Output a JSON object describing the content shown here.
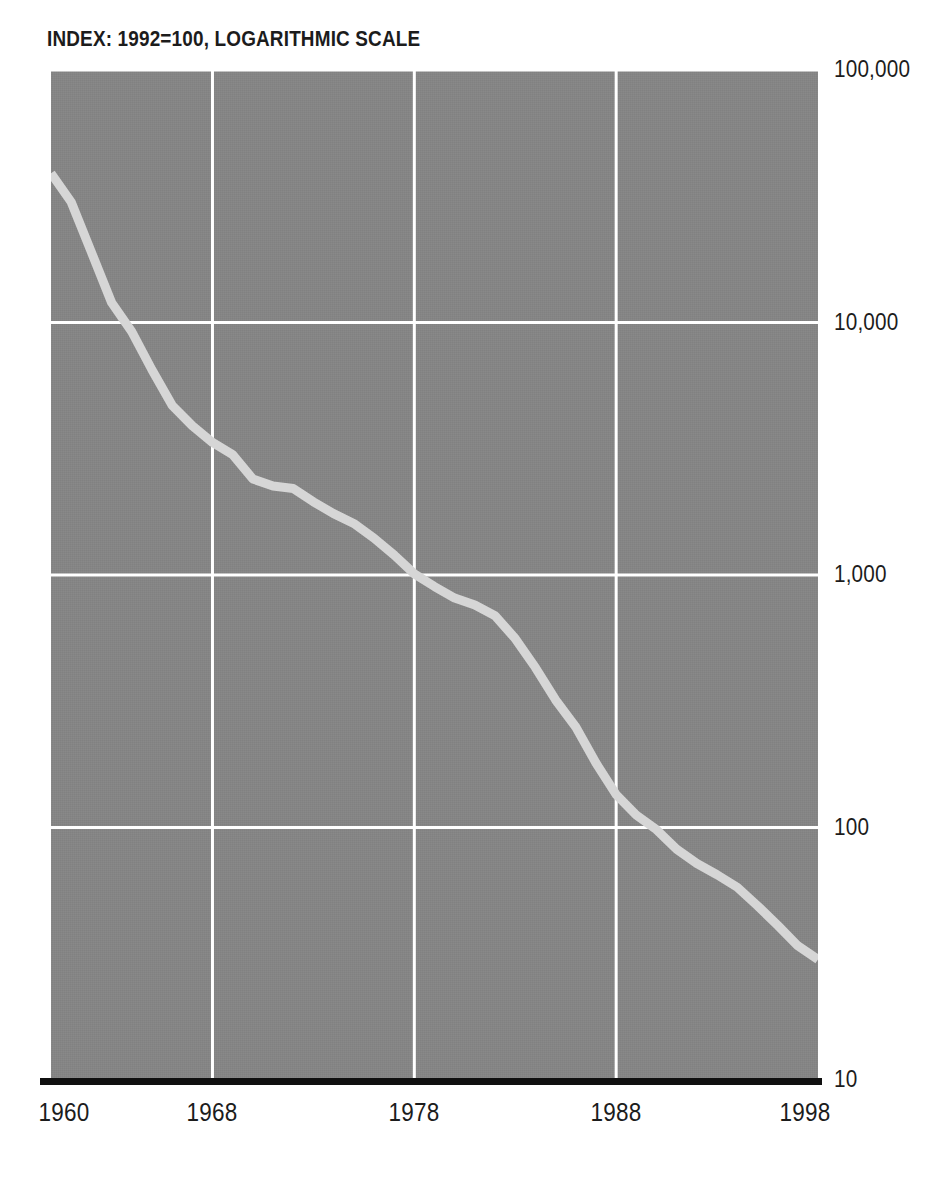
{
  "header": {
    "title_fragment": "",
    "subtitle": "INDEX: 1992=100, LOGARITHMIC SCALE"
  },
  "colors": {
    "plot_background": "#858585",
    "gridline": "#ffffff",
    "series_line": "#d6d6d6",
    "axis_baseline": "#101010",
    "text": "#1c1c1c",
    "page_background": "#ffffff"
  },
  "axes": {
    "y_ticks": [
      {
        "label": "100,000",
        "value": 100000
      },
      {
        "label": "10,000",
        "value": 10000
      },
      {
        "label": "1,000",
        "value": 1000
      },
      {
        "label": "100",
        "value": 100
      },
      {
        "label": "10",
        "value": 10
      }
    ],
    "x_ticks": [
      {
        "label": "1960",
        "value": 1960
      },
      {
        "label": "1968",
        "value": 1968
      },
      {
        "label": "1978",
        "value": 1978
      },
      {
        "label": "1988",
        "value": 1988
      },
      {
        "label": "1998",
        "value": 1998
      }
    ]
  },
  "chart_data": {
    "type": "line",
    "title": "",
    "subtitle": "INDEX: 1992=100, LOGARITHMIC SCALE",
    "xlabel": "",
    "ylabel": "",
    "yscale": "log",
    "ylim": [
      10,
      100000
    ],
    "xlim": [
      1960,
      1998
    ],
    "grid": true,
    "legend": "none",
    "y_tick_labels": [
      "100,000",
      "10,000",
      "1,000",
      "100",
      "10"
    ],
    "y_tick_values": [
      100000,
      10000,
      1000,
      100,
      10
    ],
    "x_tick_labels": [
      "1960",
      "1968",
      "1978",
      "1988",
      "1998"
    ],
    "x_tick_values": [
      1960,
      1968,
      1978,
      1988,
      1998
    ],
    "series": [
      {
        "name": "Index (1992=100)",
        "color": "#d6d6d6",
        "x": [
          1960,
          1961,
          1962,
          1963,
          1964,
          1965,
          1966,
          1967,
          1968,
          1969,
          1970,
          1971,
          1972,
          1973,
          1974,
          1975,
          1976,
          1977,
          1978,
          1979,
          1980,
          1981,
          1982,
          1983,
          1984,
          1985,
          1986,
          1987,
          1988,
          1989,
          1990,
          1991,
          1992,
          1993,
          1994,
          1995,
          1996,
          1997,
          1998
        ],
        "values": [
          39000,
          30000,
          19000,
          12000,
          9200,
          6500,
          4700,
          3900,
          3350,
          3000,
          2400,
          2250,
          2200,
          1950,
          1750,
          1600,
          1400,
          1200,
          1010,
          900,
          810,
          760,
          690,
          560,
          430,
          320,
          250,
          180,
          135,
          112,
          98,
          82,
          72,
          65,
          58,
          49,
          41,
          34,
          30
        ]
      }
    ]
  }
}
